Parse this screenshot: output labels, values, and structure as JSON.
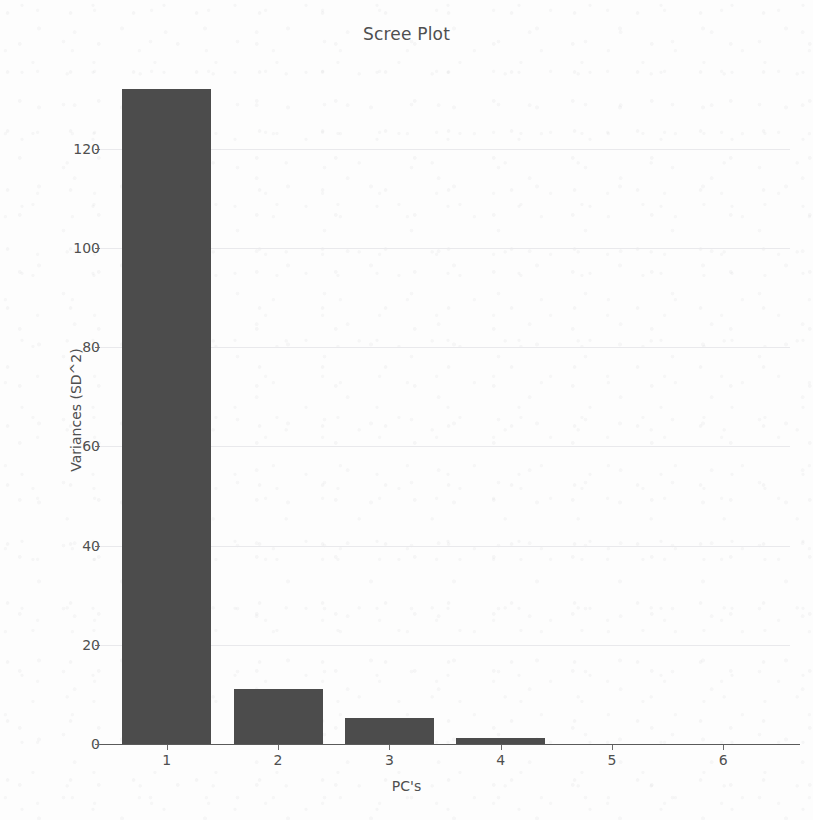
{
  "chart_data": {
    "type": "bar",
    "title": "Scree Plot",
    "xlabel": "PC's",
    "ylabel": "Variances (SD^2)",
    "categories": [
      "1",
      "2",
      "3",
      "4",
      "5",
      "6"
    ],
    "values": [
      132,
      11,
      5.2,
      1.2,
      0,
      0
    ],
    "yticks": [
      0,
      20,
      40,
      60,
      80,
      100,
      120
    ],
    "ylim": [
      0,
      132
    ],
    "xlim": [
      0.4,
      6.6
    ],
    "grid": true,
    "legend": false,
    "bar_color": "#4c4c4c",
    "background_color": "#fdfdfd",
    "grid_color": "#e9e9ec",
    "text_color": "#4f4f4f"
  }
}
